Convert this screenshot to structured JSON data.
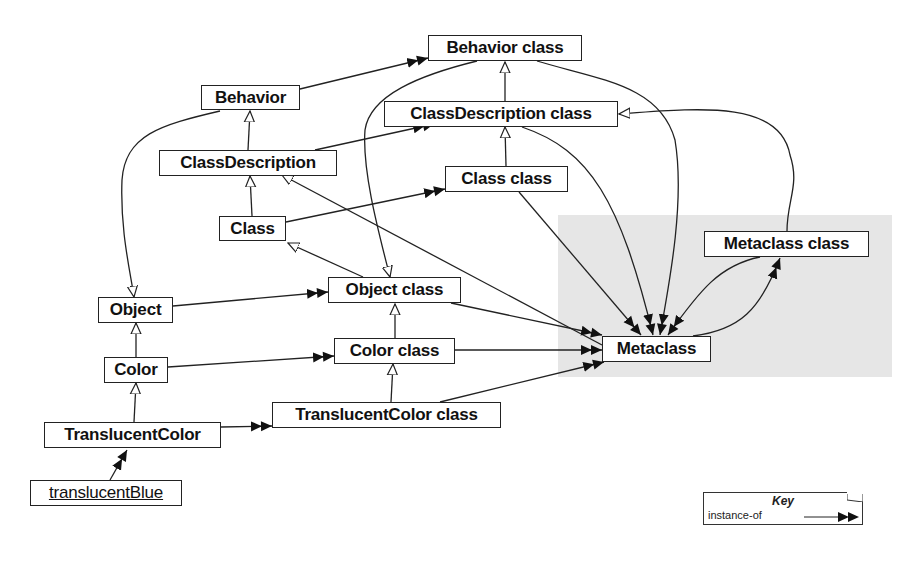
{
  "diagram": {
    "region": {
      "name": "metaclass-region",
      "color": "#e6e6e6"
    },
    "nodes": [
      {
        "id": "behavior_class",
        "label": "Behavior class",
        "x": 428,
        "y": 35,
        "w": 154,
        "h": 26,
        "kind": "class"
      },
      {
        "id": "behavior",
        "label": "Behavior",
        "x": 201,
        "y": 85,
        "w": 99,
        "h": 25,
        "kind": "class"
      },
      {
        "id": "classdescription_class",
        "label": "ClassDescription class",
        "x": 384,
        "y": 101,
        "w": 234,
        "h": 26,
        "kind": "class"
      },
      {
        "id": "classdescription",
        "label": "ClassDescription",
        "x": 159,
        "y": 150,
        "w": 178,
        "h": 26,
        "kind": "class"
      },
      {
        "id": "class_class",
        "label": "Class class",
        "x": 445,
        "y": 166,
        "w": 123,
        "h": 26,
        "kind": "class"
      },
      {
        "id": "class",
        "label": "Class",
        "x": 219,
        "y": 216,
        "w": 67,
        "h": 25,
        "kind": "class"
      },
      {
        "id": "metaclass_class",
        "label": "Metaclass class",
        "x": 704,
        "y": 231,
        "w": 165,
        "h": 26,
        "kind": "class"
      },
      {
        "id": "object_class",
        "label": "Object class",
        "x": 328,
        "y": 277,
        "w": 133,
        "h": 26,
        "kind": "class"
      },
      {
        "id": "object",
        "label": "Object",
        "x": 98,
        "y": 297,
        "w": 75,
        "h": 26,
        "kind": "class"
      },
      {
        "id": "metaclass",
        "label": "Metaclass",
        "x": 602,
        "y": 336,
        "w": 109,
        "h": 26,
        "kind": "class"
      },
      {
        "id": "color_class",
        "label": "Color class",
        "x": 334,
        "y": 338,
        "w": 121,
        "h": 26,
        "kind": "class"
      },
      {
        "id": "color",
        "label": "Color",
        "x": 104,
        "y": 357,
        "w": 64,
        "h": 26,
        "kind": "class"
      },
      {
        "id": "translucentcolor_class",
        "label": "TranslucentColor class",
        "x": 272,
        "y": 402,
        "w": 229,
        "h": 26,
        "kind": "class"
      },
      {
        "id": "translucentcolor",
        "label": "TranslucentColor",
        "x": 44,
        "y": 422,
        "w": 177,
        "h": 26,
        "kind": "class"
      },
      {
        "id": "translucentblue",
        "label": "translucentBlue",
        "x": 30,
        "y": 480,
        "w": 152,
        "h": 26,
        "kind": "instance"
      }
    ],
    "edges_inheritance": [
      [
        "classdescription_class",
        "behavior_class"
      ],
      [
        "class_class",
        "classdescription_class"
      ],
      [
        "classdescription",
        "behavior"
      ],
      [
        "class",
        "classdescription"
      ],
      [
        "color",
        "object"
      ],
      [
        "translucentcolor",
        "color"
      ],
      [
        "color_class",
        "object_class"
      ],
      [
        "translucentcolor_class",
        "color_class"
      ],
      [
        "object_class",
        "class"
      ],
      [
        "metaclass",
        "classdescription"
      ],
      [
        "behavior_class",
        "object_class"
      ],
      [
        "behavior",
        "object"
      ],
      [
        "metaclass_class",
        "classdescription_class"
      ]
    ],
    "edges_instance_of": [
      [
        "behavior",
        "behavior_class"
      ],
      [
        "classdescription",
        "classdescription_class"
      ],
      [
        "class",
        "class_class"
      ],
      [
        "object",
        "object_class"
      ],
      [
        "color",
        "color_class"
      ],
      [
        "translucentcolor",
        "translucentcolor_class"
      ],
      [
        "translucentblue",
        "translucentcolor"
      ],
      [
        "object_class",
        "metaclass"
      ],
      [
        "color_class",
        "metaclass"
      ],
      [
        "translucentcolor_class",
        "metaclass"
      ],
      [
        "class_class",
        "metaclass"
      ],
      [
        "classdescription_class",
        "metaclass"
      ],
      [
        "behavior_class",
        "metaclass"
      ],
      [
        "metaclass_class",
        "metaclass"
      ],
      [
        "metaclass",
        "metaclass_class"
      ]
    ]
  },
  "key": {
    "title": "Key",
    "label": "instance-of"
  }
}
